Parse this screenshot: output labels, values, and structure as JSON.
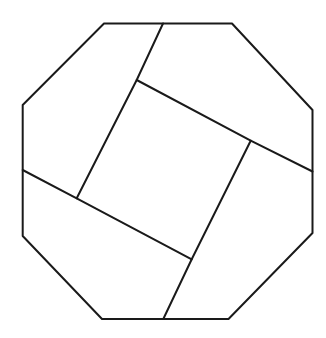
{
  "diagram": {
    "description": "Regular-ish octagon dissected into a central tilted square and four congruent surrounding pieces (pinwheel dissection)",
    "stroke_color": "#1a1a1a",
    "background_color": "#ffffff",
    "octagon": {
      "vertices": [
        [
          104,
          23.5
        ],
        [
          232,
          23.5
        ],
        [
          312.5,
          110
        ],
        [
          312.5,
          233
        ],
        [
          228.5,
          319
        ],
        [
          102,
          319
        ],
        [
          22.7,
          236
        ],
        [
          22.7,
          105
        ]
      ]
    },
    "inner_square": {
      "vertices": [
        [
          136.7,
          80
        ],
        [
          250.7,
          140.7
        ],
        [
          191.7,
          259.3
        ],
        [
          76.7,
          198.3
        ]
      ]
    },
    "cut_lines": [
      {
        "name": "top-cut",
        "from": [
          163,
          23.5
        ],
        "to": [
          136.7,
          80
        ]
      },
      {
        "name": "right-cut",
        "from": [
          312.5,
          171.5
        ],
        "to": [
          250.7,
          140.7
        ]
      },
      {
        "name": "bottom-cut",
        "from": [
          163.3,
          319
        ],
        "to": [
          191.7,
          259.3
        ]
      },
      {
        "name": "left-cut",
        "from": [
          22.7,
          170
        ],
        "to": [
          76.7,
          198.3
        ]
      }
    ],
    "piece_count": 5
  }
}
